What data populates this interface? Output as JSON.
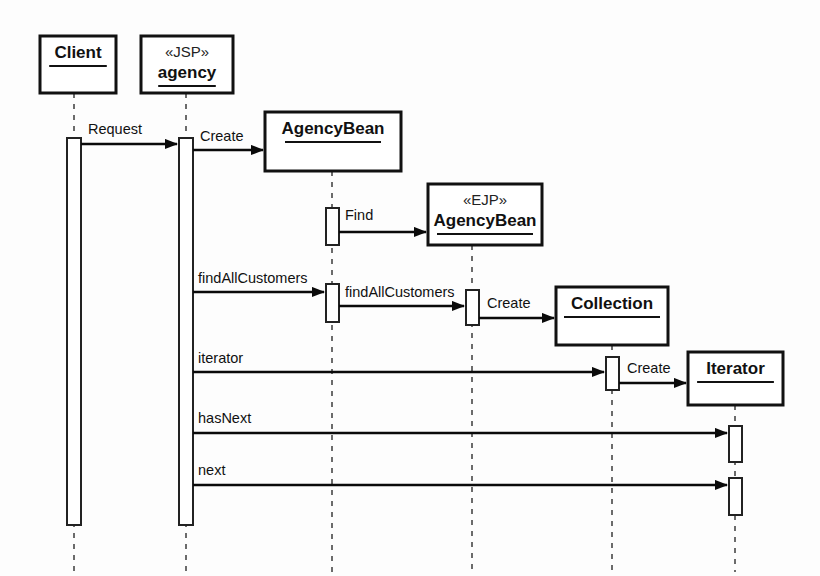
{
  "diagram": {
    "type": "uml-sequence-diagram",
    "background_color": "#fdfdfd",
    "line_color": "#0a0a0a",
    "lifeline_color": "#6b6b6b"
  },
  "participants": [
    {
      "id": "client",
      "name": "Client",
      "stereotype": "",
      "box": {
        "x": 40,
        "y": 36,
        "w": 76,
        "h": 57
      },
      "lifeline_x": 74,
      "lifeline_top": 93,
      "lifeline_bottom": 572
    },
    {
      "id": "agency",
      "name": "agency",
      "stereotype": "«JSP»",
      "box": {
        "x": 141,
        "y": 36,
        "w": 92,
        "h": 57
      },
      "lifeline_x": 186,
      "lifeline_top": 93,
      "lifeline_bottom": 572
    },
    {
      "id": "agencybean",
      "name": "AgencyBean",
      "stereotype": "",
      "box": {
        "x": 265,
        "y": 112,
        "w": 136,
        "h": 59
      },
      "lifeline_x": 332,
      "lifeline_top": 171,
      "lifeline_bottom": 572
    },
    {
      "id": "ejp-agencybean",
      "name": "AgencyBean",
      "stereotype": "«EJP»",
      "box": {
        "x": 428,
        "y": 184,
        "w": 114,
        "h": 61
      },
      "lifeline_x": 472,
      "lifeline_top": 245,
      "lifeline_bottom": 572
    },
    {
      "id": "collection",
      "name": "Collection",
      "stereotype": "",
      "box": {
        "x": 556,
        "y": 287,
        "w": 112,
        "h": 58
      },
      "lifeline_x": 612,
      "lifeline_top": 345,
      "lifeline_bottom": 572
    },
    {
      "id": "iterator",
      "name": "Iterator",
      "stereotype": "",
      "box": {
        "x": 688,
        "y": 352,
        "w": 95,
        "h": 53
      },
      "lifeline_x": 735,
      "lifeline_top": 405,
      "lifeline_bottom": 572
    }
  ],
  "activations": [
    {
      "id": "act-client",
      "participant": "client",
      "x": 67,
      "y": 138,
      "w": 14,
      "h": 387
    },
    {
      "id": "act-agency",
      "participant": "agency",
      "x": 179,
      "y": 138,
      "w": 14,
      "h": 387
    },
    {
      "id": "act-agencybean-find",
      "participant": "agencybean",
      "x": 326,
      "y": 208,
      "w": 13,
      "h": 37
    },
    {
      "id": "act-agencybean-findall",
      "participant": "agencybean",
      "x": 326,
      "y": 284,
      "w": 13,
      "h": 38
    },
    {
      "id": "act-ejp-findall",
      "participant": "ejp-agencybean",
      "x": 466,
      "y": 290,
      "w": 13,
      "h": 35
    },
    {
      "id": "act-collection-iterator",
      "participant": "collection",
      "x": 606,
      "y": 357,
      "w": 13,
      "h": 33
    },
    {
      "id": "act-iterator-hasnext",
      "participant": "iterator",
      "x": 729,
      "y": 426,
      "w": 13,
      "h": 36
    },
    {
      "id": "act-iterator-next",
      "participant": "iterator",
      "x": 729,
      "y": 478,
      "w": 13,
      "h": 37
    }
  ],
  "messages": [
    {
      "id": "msg-request",
      "label": "Request",
      "from": "client",
      "to": "agency",
      "x1": 81,
      "x2": 177,
      "y": 144,
      "label_x": 88,
      "label_y": 134
    },
    {
      "id": "msg-create-agencybean",
      "label": "Create",
      "from": "agency",
      "to": "agencybean",
      "x1": 193,
      "x2": 263,
      "y": 150,
      "label_x": 200,
      "label_y": 141
    },
    {
      "id": "msg-find",
      "label": "Find",
      "from": "agencybean",
      "to": "ejp-agencybean",
      "x1": 339,
      "x2": 426,
      "y": 232,
      "label_x": 345,
      "label_y": 220
    },
    {
      "id": "msg-findallcustomers-1",
      "label": "findAllCustomers",
      "from": "agency",
      "to": "agencybean",
      "x1": 193,
      "x2": 324,
      "y": 292,
      "label_x": 198,
      "label_y": 283
    },
    {
      "id": "msg-findallcustomers-2",
      "label": "findAllCustomers",
      "from": "agencybean",
      "to": "ejp-agencybean",
      "x1": 339,
      "x2": 464,
      "y": 306,
      "label_x": 345,
      "label_y": 297
    },
    {
      "id": "msg-create-collection",
      "label": "Create",
      "from": "ejp-agencybean",
      "to": "collection",
      "x1": 479,
      "x2": 554,
      "y": 318,
      "label_x": 487,
      "label_y": 308
    },
    {
      "id": "msg-iterator",
      "label": "iterator",
      "from": "agency",
      "to": "collection",
      "x1": 193,
      "x2": 604,
      "y": 372,
      "label_x": 198,
      "label_y": 363
    },
    {
      "id": "msg-create-iterator",
      "label": "Create",
      "from": "collection",
      "to": "iterator",
      "x1": 619,
      "x2": 686,
      "y": 383,
      "label_x": 627,
      "label_y": 373
    },
    {
      "id": "msg-hasnext",
      "label": "hasNext",
      "from": "agency",
      "to": "iterator",
      "x1": 193,
      "x2": 727,
      "y": 433,
      "label_x": 198,
      "label_y": 423
    },
    {
      "id": "msg-next",
      "label": "next",
      "from": "agency",
      "to": "iterator",
      "x1": 193,
      "x2": 727,
      "y": 485,
      "label_x": 198,
      "label_y": 475
    }
  ]
}
